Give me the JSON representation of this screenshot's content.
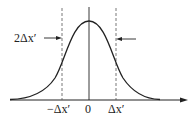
{
  "diagram": {
    "type": "gaussian-width",
    "labels": {
      "width": "2Δx′",
      "neg": "−Δx′",
      "zero": "0",
      "pos": "Δx′"
    },
    "colors": {
      "line": "#222222",
      "dash": "#555555"
    }
  }
}
